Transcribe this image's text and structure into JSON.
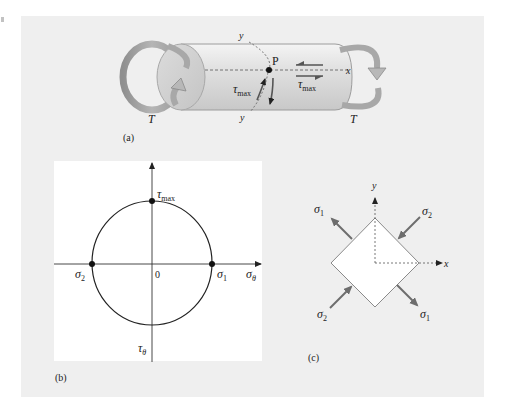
{
  "figure": {
    "panel_color": "#efefef",
    "panel_a": {
      "label": "(a)",
      "torque_left": "T",
      "torque_right": "T",
      "y_top": "y",
      "y_bottom": "y",
      "x_axis": "x",
      "point": "P",
      "tau_left": "τ",
      "tau_left_sub": "max",
      "tau_right": "τ",
      "tau_right_sub": "max"
    },
    "panel_b": {
      "label": "(b)",
      "origin": "0",
      "sigma2": "σ",
      "sigma2_sub": "2",
      "sigma1": "σ",
      "sigma1_sub": "1",
      "sigma_theta": "σ",
      "sigma_theta_sub": "θ",
      "tau_max": "τ",
      "tau_max_sub": "max",
      "tau_theta": "τ",
      "tau_theta_sub": "θ"
    },
    "panel_c": {
      "label": "(c)",
      "y_axis": "y",
      "x_axis": "x",
      "sigma1_top": "σ",
      "sigma1_top_sub": "1",
      "sigma2_top": "σ",
      "sigma2_top_sub": "2",
      "sigma2_bottom": "σ",
      "sigma2_bottom_sub": "2",
      "sigma1_bottom": "σ",
      "sigma1_bottom_sub": "1"
    }
  }
}
